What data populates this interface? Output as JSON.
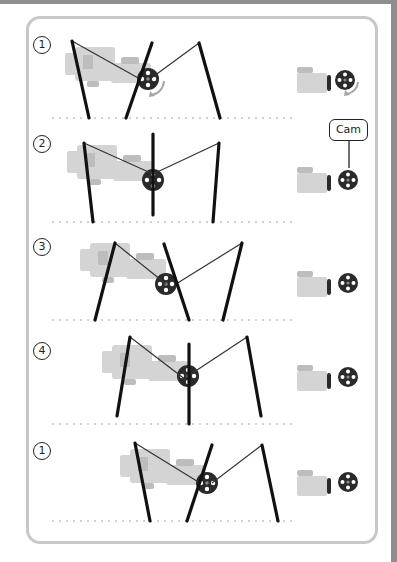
{
  "figure": {
    "cam_label": "Cam",
    "caption": "",
    "colors": {
      "leg": "#111111",
      "string": "#333333",
      "motor": "#d4d4d4",
      "motor_detail": "#bdbdbd",
      "wheel": "#2a2a2a",
      "wheel_hole": "#ffffff",
      "dots": "#9a9a9a",
      "arrow": "#a6a6a6",
      "frame": "#c8c8c8"
    }
  },
  "steps": [
    {
      "label": "1",
      "num_pos": [
        33,
        36
      ],
      "ground_y": 118,
      "motor_x": 65,
      "motor_y": 45,
      "wheel": [
        148,
        79
      ],
      "legs": [
        [
          72,
          41,
          89,
          118
        ],
        [
          152,
          43,
          126,
          118
        ],
        [
          199,
          43,
          220,
          118
        ]
      ],
      "strings": [
        [
          72,
          41,
          140,
          79
        ],
        [
          150,
          79,
          199,
          43
        ]
      ],
      "rotate_arrow": true,
      "side_icon": {
        "x": 297,
        "y": 63,
        "wheel": [
          345,
          80
        ],
        "rot": 0,
        "arrow": true
      }
    },
    {
      "label": "2",
      "num_pos": [
        33,
        135
      ],
      "ground_y": 222,
      "motor_x": 67,
      "motor_y": 143,
      "wheel": [
        153,
        180
      ],
      "legs": [
        [
          84,
          143,
          93,
          222
        ],
        [
          153,
          134,
          153,
          215
        ],
        [
          219,
          143,
          213,
          222
        ]
      ],
      "strings": [
        [
          84,
          143,
          153,
          174
        ],
        [
          153,
          174,
          219,
          143
        ]
      ],
      "rotate_arrow": false,
      "side_icon": {
        "x": 297,
        "y": 163,
        "wheel": [
          348,
          180
        ],
        "rot": 90,
        "arrow": false
      }
    },
    {
      "label": "3",
      "num_pos": [
        33,
        238
      ],
      "ground_y": 320,
      "motor_x": 80,
      "motor_y": 241,
      "wheel": [
        166,
        284
      ],
      "legs": [
        [
          115,
          243,
          95,
          320
        ],
        [
          164,
          244,
          189,
          320
        ],
        [
          242,
          243,
          223,
          320
        ]
      ],
      "strings": [
        [
          115,
          243,
          166,
          284
        ],
        [
          176,
          284,
          242,
          243
        ]
      ],
      "rotate_arrow": false,
      "side_icon": {
        "x": 297,
        "y": 267,
        "wheel": [
          348,
          283
        ],
        "rot": 180,
        "arrow": false
      }
    },
    {
      "label": "4",
      "num_pos": [
        33,
        342
      ],
      "ground_y": 424,
      "motor_x": 102,
      "motor_y": 343,
      "wheel": [
        188,
        376
      ],
      "legs": [
        [
          130,
          337,
          117,
          416
        ],
        [
          189,
          344,
          189,
          424
        ],
        [
          247,
          337,
          261,
          416
        ]
      ],
      "strings": [
        [
          130,
          337,
          186,
          380
        ],
        [
          188,
          376,
          247,
          337
        ]
      ],
      "rotate_arrow": false,
      "side_icon": {
        "x": 297,
        "y": 361,
        "wheel": [
          348,
          377
        ],
        "rot": 270,
        "arrow": false
      }
    },
    {
      "label": "1",
      "num_pos": [
        33,
        442
      ],
      "ground_y": 521,
      "motor_x": 120,
      "motor_y": 447,
      "wheel": [
        207,
        483
      ],
      "legs": [
        [
          135,
          443,
          150,
          521
        ],
        [
          212,
          445,
          187,
          521
        ],
        [
          262,
          445,
          278,
          521
        ]
      ],
      "strings": [
        [
          135,
          443,
          200,
          483
        ],
        [
          212,
          483,
          262,
          445
        ]
      ],
      "rotate_arrow": false,
      "side_icon": {
        "x": 297,
        "y": 466,
        "wheel": [
          348,
          482
        ],
        "rot": 0,
        "arrow": false
      }
    }
  ],
  "ground": {
    "x_start": 53,
    "x_end": 296,
    "spacing": 7
  }
}
